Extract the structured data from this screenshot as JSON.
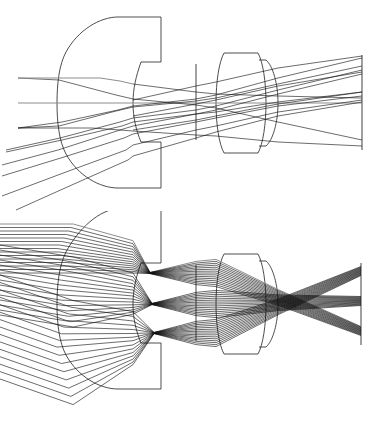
{
  "figure": {
    "width": 379,
    "height": 422,
    "background_color": "#ffffff",
    "panel_count": 2
  },
  "colors": {
    "ray": "#111111",
    "axis_ray": "#8d8d8d",
    "lens_outline": "#3a3a3a",
    "stop": "#444444",
    "image_plane": "#777777",
    "background": "#ffffff"
  },
  "panels": [
    {
      "id": "panel-top",
      "name": "sparse-ray-trace",
      "label": "Top panel: sparse ray fan",
      "origin_y": 0,
      "height": 211,
      "ray_count": 9,
      "field_angle_count": 3,
      "rays_per_field": 3
    },
    {
      "id": "panel-bottom",
      "name": "dense-ray-trace",
      "label": "Bottom panel: dense ray fan",
      "origin_y": 211,
      "height": 211,
      "ray_count": 45,
      "field_angle_count": 3,
      "rays_per_field": 15
    }
  ],
  "optics": {
    "axis_y": 103,
    "elements": [
      {
        "name": "front-meniscus-lens",
        "type": "thick negative meniscus",
        "front_vertex_x": 57,
        "rear_vertex_x": 133,
        "edge_x": 161,
        "top_y": 17,
        "bottom_y": 188,
        "clear_top_y": 62,
        "clear_bottom_y": 142,
        "front_radius_px": 88,
        "rear_radius_px": 44
      },
      {
        "name": "aperture-stop",
        "type": "stop",
        "x": 196,
        "top_y": 64,
        "bottom_y": 140
      },
      {
        "name": "rear-doublet-front-element",
        "type": "biconvex",
        "left_x": 207,
        "right_x": 265,
        "top_y": 53,
        "bottom_y": 153,
        "edge_top_y": 60,
        "edge_bottom_y": 146
      },
      {
        "name": "rear-doublet-back-element",
        "type": "meniscus cap",
        "left_x": 265,
        "right_x": 282,
        "top_y": 60,
        "bottom_y": 146
      },
      {
        "name": "image-plane",
        "type": "detector",
        "x": 362,
        "top_y": 55,
        "bottom_y": 150
      }
    ]
  },
  "chart_data": {
    "type": "line",
    "xlabel": "",
    "ylabel": "",
    "grid": false,
    "legend": "none",
    "xlim": [
      0,
      379
    ],
    "ylim": [
      0,
      211
    ],
    "series": [
      {
        "name": "on-axis-field-rays",
        "field_angle_deg": 0,
        "values": []
      },
      {
        "name": "mid-field-rays",
        "field_angle_deg": 14,
        "values": []
      },
      {
        "name": "full-field-rays",
        "field_angle_deg": 28,
        "values": []
      }
    ],
    "annotations": [
      {
        "text": "front meniscus element",
        "x": 100,
        "y": 100
      },
      {
        "text": "aperture stop",
        "x": 196,
        "y": 103
      },
      {
        "text": "rear doublet",
        "x": 240,
        "y": 103
      },
      {
        "text": "image plane",
        "x": 362,
        "y": 103
      }
    ]
  }
}
